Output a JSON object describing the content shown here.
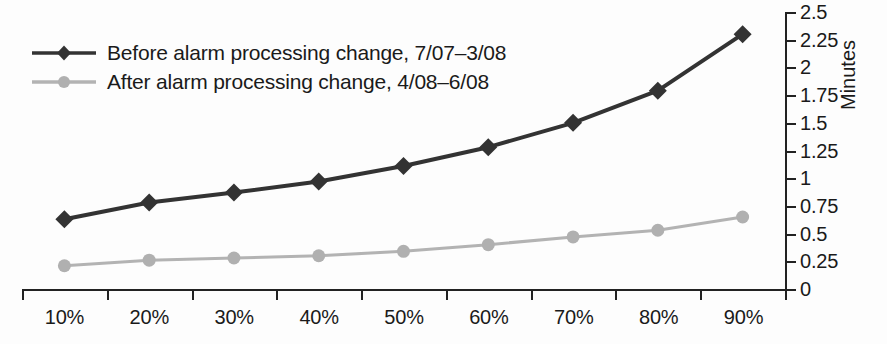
{
  "chart_data": {
    "type": "line",
    "title": "",
    "xlabel": "",
    "ylabel": "Minutes",
    "categories": [
      "10%",
      "20%",
      "30%",
      "40%",
      "50%",
      "60%",
      "70%",
      "80%",
      "90%"
    ],
    "ylim": [
      0,
      2.5
    ],
    "ytick_labels": [
      "2.5",
      "2.25",
      "2",
      "1.75",
      "1.5",
      "1.25",
      "1",
      "0.75",
      "0.5",
      "0.25",
      "0"
    ],
    "ytick_values": [
      2.5,
      2.25,
      2,
      1.75,
      1.5,
      1.25,
      1,
      0.75,
      0.5,
      0.25,
      0
    ],
    "grid": false,
    "legend_position": "top-left",
    "series": [
      {
        "name": "Before alarm processing change, 7/07–3/08",
        "color": "#333333",
        "marker": "diamond",
        "values": [
          0.63,
          0.78,
          0.87,
          0.97,
          1.11,
          1.28,
          1.5,
          1.79,
          2.3
        ]
      },
      {
        "name": "After alarm processing change, 4/08–6/08",
        "color": "#b3b3b3",
        "marker": "circle",
        "values": [
          0.21,
          0.26,
          0.28,
          0.3,
          0.34,
          0.4,
          0.47,
          0.53,
          0.65
        ]
      }
    ]
  },
  "axis": {
    "y_title": "Minutes"
  },
  "colors": {
    "before_series": "#333333",
    "after_series": "#b3b3b3",
    "axis": "#222222",
    "background": "#fdfdfd"
  }
}
